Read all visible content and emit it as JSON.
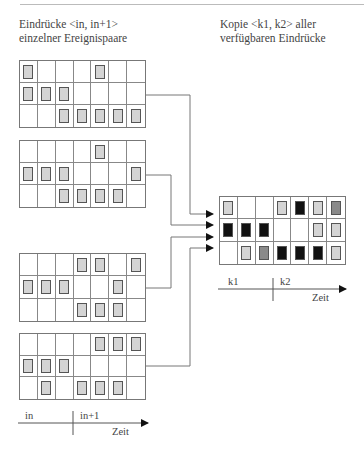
{
  "headings": {
    "left": {
      "line1": "Eindrücke <in, in+1>",
      "line2": "einzelner Ereignispaare"
    },
    "right": {
      "line1": "Kopie <k1, k2> aller",
      "line2": "verfügbaren Eindrücke"
    }
  },
  "input_grids": [
    {
      "id": "pair-1",
      "rows": [
        [
          1,
          0,
          0,
          0,
          1,
          0,
          0
        ],
        [
          1,
          1,
          1,
          0,
          0,
          0,
          0
        ],
        [
          0,
          0,
          1,
          1,
          1,
          1,
          1
        ]
      ]
    },
    {
      "id": "pair-2",
      "rows": [
        [
          0,
          0,
          0,
          0,
          1,
          0,
          0
        ],
        [
          1,
          1,
          1,
          0,
          0,
          0,
          1
        ],
        [
          0,
          0,
          1,
          1,
          1,
          1,
          0
        ]
      ]
    },
    {
      "id": "pair-3",
      "rows": [
        [
          0,
          0,
          0,
          1,
          1,
          0,
          1
        ],
        [
          1,
          1,
          1,
          0,
          0,
          1,
          0
        ],
        [
          0,
          0,
          0,
          1,
          1,
          1,
          0
        ]
      ]
    },
    {
      "id": "pair-4",
      "rows": [
        [
          0,
          0,
          0,
          0,
          1,
          1,
          1
        ],
        [
          1,
          1,
          1,
          0,
          0,
          0,
          0
        ],
        [
          0,
          1,
          0,
          1,
          1,
          1,
          0
        ]
      ]
    }
  ],
  "output_grid": {
    "legend": {
      "0": "empty",
      "1": "light",
      "2": "mid",
      "3": "dark"
    },
    "rows": [
      [
        1,
        0,
        0,
        1,
        3,
        1,
        2
      ],
      [
        3,
        3,
        3,
        0,
        0,
        1,
        1
      ],
      [
        0,
        1,
        2,
        3,
        3,
        3,
        1
      ]
    ]
  },
  "left_axis": {
    "label_a": "in",
    "label_b": "in+1",
    "time": "Zeit"
  },
  "right_axis": {
    "label_a": "k1",
    "label_b": "k2",
    "time": "Zeit"
  },
  "colors": {
    "light": "#d4d4d4",
    "mid": "#8a8a8a",
    "dark": "#111111",
    "line": "#777777"
  }
}
